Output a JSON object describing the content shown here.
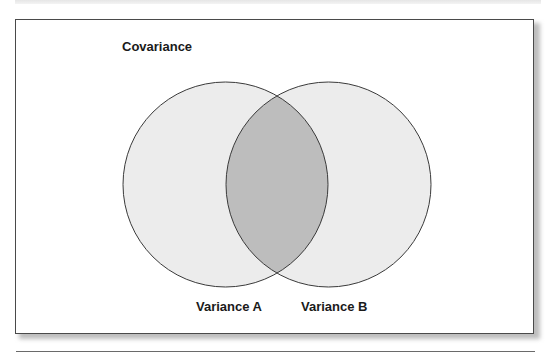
{
  "diagram": {
    "title": "Covariance",
    "sets": [
      {
        "label": "Variance A",
        "cx": 225.5,
        "cy": 184.5,
        "r": 102.5
      },
      {
        "label": "Variance B",
        "cx": 328.5,
        "cy": 184.5,
        "r": 102.5
      }
    ],
    "overlap_label": "Covariance",
    "colors": {
      "set_fill": "#ececec",
      "overlap_fill": "#bdbdbd",
      "stroke": "#3a3a3a",
      "text": "#1a1a1a",
      "frame_border": "#4a4a4a"
    }
  }
}
